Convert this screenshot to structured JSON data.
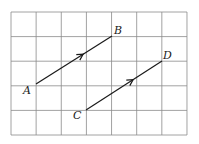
{
  "grid": {
    "cols": 7,
    "rows": 5,
    "origin_x": 11,
    "origin_y": 12,
    "cell_w": 25.14,
    "cell_h": 24.6,
    "line_color": "#8a8a8a"
  },
  "vectors": [
    {
      "name": "AB",
      "start": {
        "label": "A",
        "x": 36,
        "y": 84
      },
      "end": {
        "label": "B",
        "x": 112,
        "y": 36
      }
    },
    {
      "name": "CD",
      "start": {
        "label": "C",
        "x": 86,
        "y": 110
      },
      "end": {
        "label": "D",
        "x": 162,
        "y": 61
      }
    }
  ],
  "labels": {
    "A": "A",
    "B": "B",
    "C": "C",
    "D": "D"
  }
}
